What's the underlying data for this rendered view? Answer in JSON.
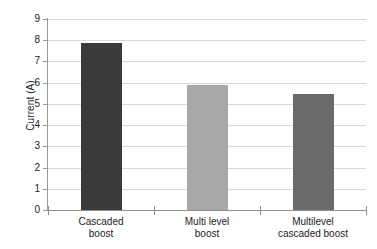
{
  "chart_data": {
    "type": "bar",
    "title": "",
    "xlabel": "",
    "ylabel": "Current (A)",
    "categories": [
      "Cascaded boost",
      "Multi level boost",
      "Multilevel cascaded boost"
    ],
    "category_lines": [
      [
        "Cascaded",
        "boost"
      ],
      [
        "Multi level",
        "boost"
      ],
      [
        "Multilevel",
        "cascaded boost"
      ]
    ],
    "values": [
      7.85,
      5.9,
      5.45
    ],
    "ylim": [
      0,
      9
    ],
    "ytick_labels": [
      "0",
      "1",
      "2",
      "3",
      "4",
      "5",
      "6",
      "7",
      "8",
      "9"
    ],
    "ytick_values": [
      0,
      1,
      2,
      3,
      4,
      5,
      6,
      7,
      8,
      9
    ],
    "grid": "horizontal",
    "legend": "none",
    "bar_colors": [
      "#3a3a3a",
      "#a8a8a8",
      "#6a6a6a"
    ]
  },
  "colors": {
    "background": "#ffffff",
    "gridline": "#d8d8d8",
    "axis": "#8f8f8f",
    "text": "#1b1b1b"
  }
}
